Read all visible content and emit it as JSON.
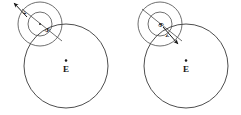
{
  "figure": {
    "background_color": "#ffffff",
    "line_color": "#3a3a3a",
    "label_color": "#141414",
    "width": 241,
    "height": 115,
    "panels": [
      {
        "id": "left",
        "name": "panel-left",
        "earth": {
          "label": "E",
          "center_x": 66,
          "center_y": 66,
          "radius": 42,
          "center_dot": true
        },
        "orbit_outer": {
          "center_x": 40,
          "center_y": 24,
          "radius": 22
        },
        "orbit_inner": {
          "center_x": 40,
          "center_y": 24,
          "radius": 12
        },
        "radius_line_label": "S",
        "velocity_label": "v",
        "velocity_direction": "up-left"
      },
      {
        "id": "right",
        "name": "panel-right",
        "earth": {
          "label": "E",
          "center_x": 186,
          "center_y": 66,
          "radius": 42,
          "center_dot": true
        },
        "orbit_outer": {
          "center_x": 160,
          "center_y": 24,
          "radius": 22
        },
        "orbit_inner": {
          "center_x": 160,
          "center_y": 24,
          "radius": 12
        },
        "radius_line_label": "S",
        "velocity_label": "v",
        "velocity_direction": "down-right"
      }
    ]
  }
}
